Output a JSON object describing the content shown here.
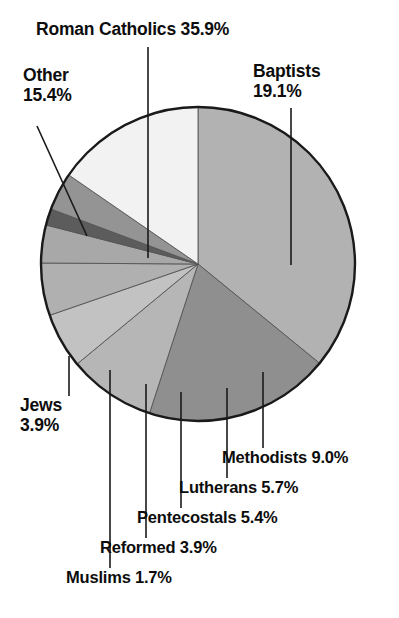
{
  "chart_data": {
    "type": "pie",
    "title": "",
    "subtitle": "",
    "xlabel": "",
    "ylabel": "",
    "legend_position": "none",
    "grid": false,
    "units": "percent",
    "total": 100,
    "center": {
      "x": 198,
      "y": 264,
      "radius": 157
    },
    "start_angle_deg": -90,
    "direction": "clockwise",
    "categories": [
      "Roman Catholics",
      "Baptists",
      "Methodists",
      "Lutherans",
      "Pentecostals",
      "Reformed",
      "Muslims",
      "Jews",
      "Other"
    ],
    "values": [
      35.9,
      19.1,
      9.0,
      5.7,
      5.4,
      3.9,
      1.7,
      3.9,
      15.4
    ],
    "slices": [
      {
        "name": "Roman Catholics",
        "value": 35.9,
        "label": "Roman Catholics 35.9%",
        "name_text": "Roman Catholics",
        "pct_text": "35.9%",
        "color": "#b2b2b2",
        "start_deg": -90.0,
        "end_deg": 39.24
      },
      {
        "name": "Baptists",
        "value": 19.1,
        "label": "Baptists 19.1%",
        "name_text": "Baptists",
        "pct_text": "19.1%",
        "color": "#8f8f8f",
        "start_deg": 39.24,
        "end_deg": 108.0
      },
      {
        "name": "Methodists",
        "value": 9.0,
        "label": "Methodists 9.0%",
        "name_text": "Methodists",
        "pct_text": "9.0%",
        "color": "#b6b6b6",
        "start_deg": 108.0,
        "end_deg": 140.4
      },
      {
        "name": "Lutherans",
        "value": 5.7,
        "label": "Lutherans 5.7%",
        "name_text": "Lutherans",
        "pct_text": "5.7%",
        "color": "#c2c2c2",
        "start_deg": 140.4,
        "end_deg": 160.92
      },
      {
        "name": "Pentecostals",
        "value": 5.4,
        "label": "Pentecostals 5.4%",
        "name_text": "Pentecostals",
        "pct_text": "5.4%",
        "color": "#b0b0b0",
        "start_deg": 160.92,
        "end_deg": 180.36
      },
      {
        "name": "Reformed",
        "value": 3.9,
        "label": "Reformed 3.9%",
        "name_text": "Reformed",
        "pct_text": "3.9%",
        "color": "#a8a8a8",
        "start_deg": 180.36,
        "end_deg": 194.4
      },
      {
        "name": "Muslims",
        "value": 1.7,
        "label": "Muslims 1.7%",
        "name_text": "Muslims",
        "pct_text": "1.7%",
        "color": "#5c5c5c",
        "start_deg": 194.4,
        "end_deg": 200.52
      },
      {
        "name": "Jews",
        "value": 3.9,
        "label": "Jews 3.9%",
        "name_text": "Jews",
        "pct_text": "3.9%",
        "color": "#949494",
        "start_deg": 200.52,
        "end_deg": 214.56
      },
      {
        "name": "Other",
        "value": 15.4,
        "label": "Other 15.4%",
        "name_text": "Other",
        "pct_text": "15.4%",
        "color": "#f2f2f2",
        "start_deg": 214.56,
        "end_deg": 270.0
      }
    ],
    "annotations": [
      {
        "name": "Roman Catholics",
        "text": "Roman Catholics 35.9%"
      },
      {
        "name": "Other",
        "text": "Other 15.4%"
      },
      {
        "name": "Baptists",
        "text": "Baptists 19.1%"
      },
      {
        "name": "Jews",
        "text": "Jews 3.9%"
      },
      {
        "name": "Methodists",
        "text": "Methodists 9.0%"
      },
      {
        "name": "Lutherans",
        "text": "Lutherans 5.7%"
      },
      {
        "name": "Pentecostals",
        "text": "Pentecostals 5.4%"
      },
      {
        "name": "Reformed",
        "text": "Reformed 3.9%"
      },
      {
        "name": "Muslims",
        "text": "Muslims 1.7%"
      }
    ]
  },
  "labels": {
    "roman_catholics": {
      "line1": "Roman Catholics 35.9%"
    },
    "other": {
      "line1": "Other",
      "line2": "15.4%"
    },
    "baptists": {
      "line1": "Baptists",
      "line2": "19.1%"
    },
    "jews": {
      "line1": "Jews",
      "line2": "3.9%"
    },
    "methodists": {
      "line1": "Methodists 9.0%"
    },
    "lutherans": {
      "line1": "Lutherans 5.7%"
    },
    "pentecostals": {
      "line1": "Pentecostals 5.4%"
    },
    "reformed": {
      "line1": "Reformed 3.9%"
    },
    "muslims": {
      "line1": "Muslims 1.7%"
    }
  },
  "style": {
    "background": "#ffffff",
    "text_color": "#0d0d0d",
    "outline_color": "#1a1a1a",
    "leader_color": "#1a1a1a"
  }
}
